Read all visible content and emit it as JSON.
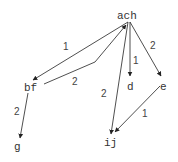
{
  "diagram": {
    "type": "directed-graph",
    "nodes": [
      {
        "id": "ach",
        "label": "ach",
        "x": 128,
        "y": 18
      },
      {
        "id": "bf",
        "label": "bf",
        "x": 31,
        "y": 89
      },
      {
        "id": "g",
        "label": "g",
        "x": 17,
        "y": 150
      },
      {
        "id": "d",
        "label": "d",
        "x": 130,
        "y": 89
      },
      {
        "id": "e",
        "label": "e",
        "x": 163,
        "y": 89
      },
      {
        "id": "ij",
        "label": "ij",
        "x": 109,
        "y": 146
      }
    ],
    "edges": [
      {
        "from": "ach",
        "to": "bf",
        "label": "1"
      },
      {
        "from": "bf",
        "to": "ach",
        "label": "2"
      },
      {
        "from": "ach",
        "to": "ij",
        "label": "2"
      },
      {
        "from": "ach",
        "to": "d",
        "label": "1"
      },
      {
        "from": "ach",
        "to": "e",
        "label": "2"
      },
      {
        "from": "bf",
        "to": "g",
        "label": "2"
      },
      {
        "from": "e",
        "to": "ij",
        "label": "1"
      }
    ],
    "colors": {
      "edge": "#222222",
      "text": "#333333",
      "background": "#ffffff"
    }
  }
}
